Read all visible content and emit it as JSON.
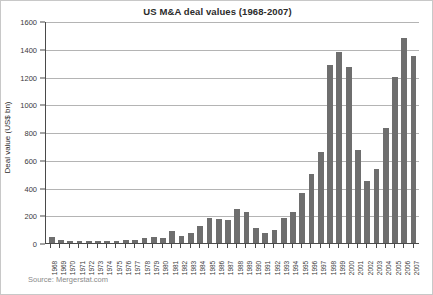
{
  "figure": {
    "title": "US M&A deal values (1968-2007)",
    "source": "Source: Mergerstat.com"
  },
  "axes": {
    "y_title": "Deal value (US$ bn)",
    "y_ticks": [
      "1600",
      "1400",
      "1200",
      "1000",
      "800",
      "600",
      "400",
      "200",
      "0"
    ]
  },
  "chart_data": {
    "type": "bar",
    "title": "US M&A deal values (1968-2007)",
    "xlabel": "",
    "ylabel": "Deal value (US$ bn)",
    "ylim": [
      0,
      1600
    ],
    "ytick_step": 200,
    "grid": true,
    "legend": false,
    "bar_color": "#6e6e6e",
    "source": "Source: Mergerstat.com",
    "categories": [
      "1968",
      "1969",
      "1970",
      "1971",
      "1972",
      "1973",
      "1974",
      "1975",
      "1976",
      "1977",
      "1978",
      "1979",
      "1980",
      "1981",
      "1982",
      "1983",
      "1984",
      "1985",
      "1986",
      "1987",
      "1988",
      "1989",
      "1990",
      "1991",
      "1992",
      "1993",
      "1994",
      "1995",
      "1996",
      "1997",
      "1998",
      "1999",
      "2000",
      "2001",
      "2002",
      "2003",
      "2004",
      "2005",
      "2006",
      "2007"
    ],
    "values": [
      43,
      24,
      16,
      13,
      17,
      17,
      13,
      12,
      20,
      22,
      34,
      44,
      33,
      83,
      54,
      73,
      122,
      180,
      174,
      164,
      247,
      222,
      109,
      72,
      97,
      177,
      227,
      357,
      496,
      657,
      1280,
      1380,
      1270,
      670,
      450,
      530,
      830,
      1200,
      1480,
      1350
    ],
    "units": "US$ bn"
  }
}
